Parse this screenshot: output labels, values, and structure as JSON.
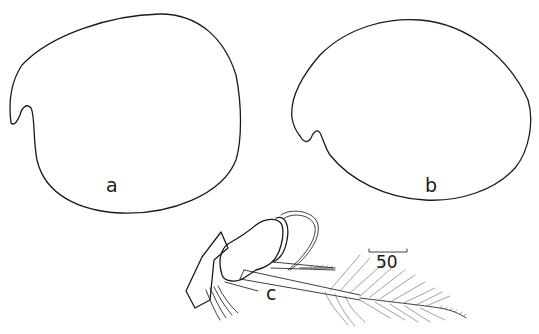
{
  "figure": {
    "panels": [
      {
        "id": "a",
        "label": "a",
        "description": "shell outline, left view"
      },
      {
        "id": "b",
        "label": "b",
        "description": "shell outline, right view"
      },
      {
        "id": "c",
        "label": "c",
        "description": "appendage with plumose setae"
      }
    ],
    "scale_bar": {
      "label": "50"
    },
    "colors": {
      "line": "#1a1a1a",
      "background": "#ffffff"
    }
  }
}
